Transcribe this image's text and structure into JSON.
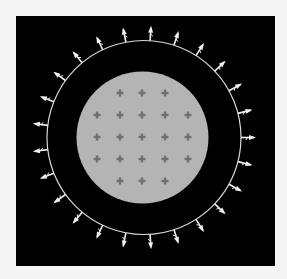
{
  "canvas": {
    "width": 287,
    "height": 279,
    "background": "#f5f5f5"
  },
  "frame": {
    "x": 16,
    "y": 16,
    "width": 259,
    "height": 250,
    "fill": "#000000"
  },
  "outer_circle": {
    "cx": 144,
    "cy": 137.5,
    "r": 97,
    "stroke": "#d8d8d8",
    "stroke_width": 1.2
  },
  "inner_disk": {
    "cx": 142.5,
    "cy": 137.5,
    "r": 66,
    "fill": "#b4b4b4"
  },
  "arrows": {
    "count": 25,
    "start_angle_deg": 0,
    "length": 15,
    "head_size": 5,
    "color": "#f0f0f0",
    "icon": "outward-arrow-icon"
  },
  "crosses": {
    "color": "#707070",
    "size": 7,
    "thickness": 2.4,
    "icon": "plus-marker-icon",
    "points": [
      [
        120,
        93
      ],
      [
        142,
        93
      ],
      [
        165,
        93
      ],
      [
        97,
        115
      ],
      [
        120,
        115
      ],
      [
        142,
        115
      ],
      [
        165,
        115
      ],
      [
        188,
        115
      ],
      [
        97,
        137
      ],
      [
        120,
        137
      ],
      [
        142,
        137
      ],
      [
        165,
        137
      ],
      [
        188,
        137
      ],
      [
        97,
        159
      ],
      [
        120,
        159
      ],
      [
        142,
        159
      ],
      [
        165,
        159
      ],
      [
        188,
        159
      ],
      [
        120,
        181
      ],
      [
        142,
        181
      ],
      [
        165,
        181
      ]
    ]
  }
}
